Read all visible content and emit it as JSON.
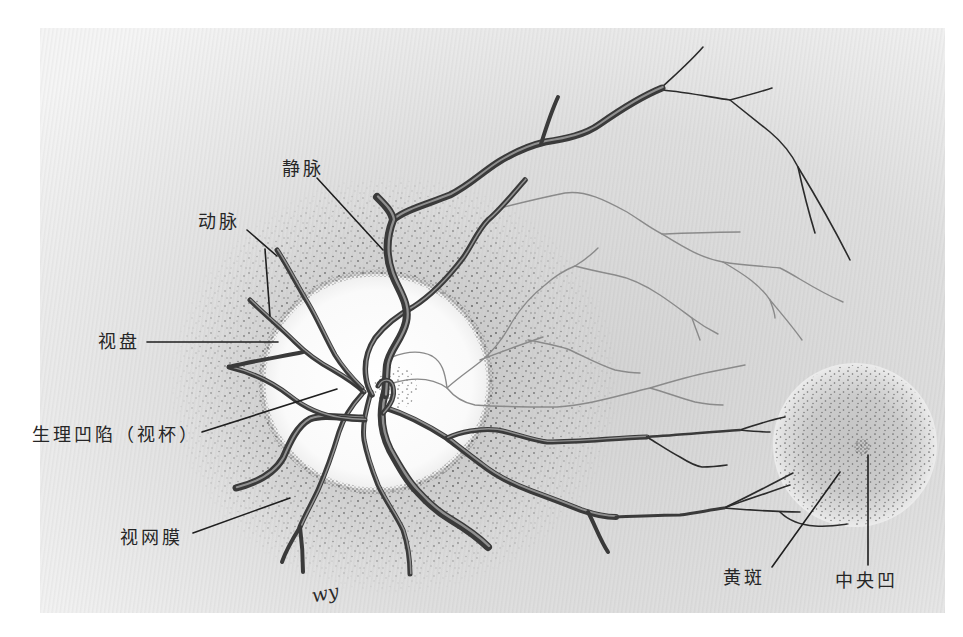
{
  "labels": {
    "vein": "静脉",
    "artery": "动脉",
    "optic_disc": "视盘",
    "physiological_cup": "生理凹陷（视杯）",
    "retina": "视网膜",
    "macula": "黄斑",
    "fovea": "中央凹"
  },
  "signature": "wy",
  "colors": {
    "page_background": "#ffffff",
    "paper": "#dedede",
    "vessel": "#3a3a3a",
    "vessel_highlight": "#909090",
    "fine_vessel_dark": "#2b2b2b",
    "fine_vessel_gray": "#8a8a8a",
    "optic_disc": "#fbfbfb",
    "label_text": "#262626",
    "leader_line": "#1f1f1f"
  }
}
